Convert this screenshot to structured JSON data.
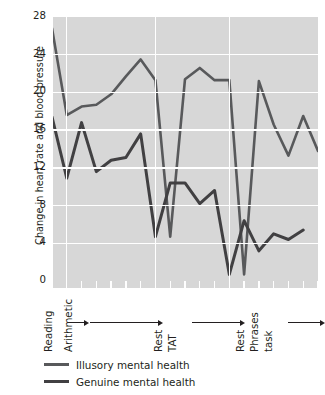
{
  "chart_data": {
    "type": "line",
    "title": "",
    "xlabel": "",
    "ylabel": "Change in heart rate and blood pressure",
    "ylim": [
      0,
      28
    ],
    "yticks": [
      0,
      4,
      8,
      12,
      16,
      20,
      24,
      28
    ],
    "ytick_labels": [
      "0",
      "4",
      "8",
      "12",
      "16",
      "20",
      "24",
      "28"
    ],
    "grid": true,
    "grid_color": "#ffffff",
    "panel_color": "#d7d7d7",
    "legend_position": "below-axes-left",
    "x_phase_labels": [
      "Reading",
      "Arithmetic",
      "Rest",
      "TAT",
      "Rest",
      "Phrases",
      "task"
    ],
    "x_phase_boundaries": [
      0,
      1,
      7,
      12
    ],
    "xlim": [
      0,
      18
    ],
    "series": [
      {
        "name": "Illusory mental health",
        "color": "#58595b",
        "width": 2.6,
        "x": [
          0,
          1,
          2,
          3,
          4,
          5,
          6,
          7,
          8,
          9,
          10,
          11,
          12,
          13,
          14,
          15,
          16,
          17,
          18
        ],
        "values": [
          26.8,
          17.6,
          18.5,
          18.7,
          19.8,
          21.7,
          23.5,
          21.3,
          4.7,
          21.4,
          22.6,
          21.3,
          21.3,
          0.7,
          21.2,
          16.6,
          13.3,
          17.5,
          13.8
        ]
      },
      {
        "name": "Genuine mental health",
        "color": "#414042",
        "width": 3.0,
        "x": [
          0,
          1,
          2,
          3,
          4,
          5,
          6,
          7,
          8,
          9,
          10,
          11,
          12,
          13,
          14,
          15,
          16,
          17
        ],
        "values": [
          17.4,
          10.9,
          16.8,
          11.6,
          12.8,
          13.1,
          15.6,
          4.7,
          10.4,
          10.4,
          8.2,
          9.6,
          0.7,
          6.4,
          3.2,
          5.0,
          4.4,
          5.4
        ]
      }
    ]
  },
  "legend": {
    "items": [
      {
        "label": "Illusory mental health"
      },
      {
        "label": "Genuine mental health"
      }
    ]
  }
}
